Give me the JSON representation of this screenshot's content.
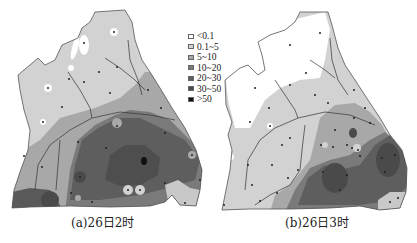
{
  "legend": {
    "items": [
      {
        "label": "<0.1",
        "color": "#ffffff"
      },
      {
        "label": "0.1~5",
        "color": "#d2d2d2"
      },
      {
        "label": "5~10",
        "color": "#a8a8a8"
      },
      {
        "label": "10~20",
        "color": "#7a7a7a"
      },
      {
        "label": "20~30",
        "color": "#5e5e5e"
      },
      {
        "label": "30~50",
        "color": "#4a4a4a"
      },
      {
        "label": ">50",
        "color": "#111111"
      }
    ]
  },
  "panels": [
    {
      "caption": "(a)26日2时"
    },
    {
      "caption": "(b)26日3时"
    }
  ]
}
